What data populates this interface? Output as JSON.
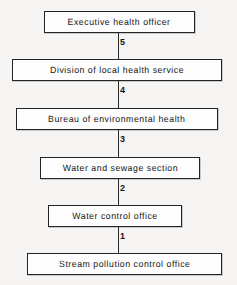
{
  "diagram": {
    "type": "flowchart",
    "orientation": "vertical-top-down",
    "background_color": "#f6f5f3",
    "box_fill_color": "#fefefe",
    "line_color": "#242424",
    "text_color": "#151515",
    "nodes": [
      {
        "id": "n5",
        "label": "Executive health officer",
        "level": 6,
        "left": 44,
        "top": 11,
        "width": 151
      },
      {
        "id": "n4",
        "label": "Division of local health service",
        "level": 5,
        "left": 12,
        "top": 59,
        "width": 210
      },
      {
        "id": "n3",
        "label": "Bureau of environmental health",
        "level": 4,
        "left": 16,
        "top": 108,
        "width": 202
      },
      {
        "id": "n2",
        "label": "Water and sewage section",
        "level": 3,
        "left": 40,
        "top": 157,
        "width": 160
      },
      {
        "id": "n1",
        "label": "Water control office",
        "level": 2,
        "left": 48,
        "top": 205,
        "width": 134
      },
      {
        "id": "n0",
        "label": "Stream pollution control office",
        "level": 1,
        "left": 27,
        "top": 253,
        "width": 195
      }
    ],
    "edges": [
      {
        "id": "e5",
        "label": "5",
        "from": "n5",
        "to": "n4",
        "top": 33,
        "height": 26,
        "label_x": 120,
        "label_y": 38
      },
      {
        "id": "e4",
        "label": "4",
        "from": "n4",
        "to": "n3",
        "top": 81,
        "height": 27,
        "label_x": 120,
        "label_y": 86
      },
      {
        "id": "e3",
        "label": "3",
        "from": "n3",
        "to": "n2",
        "top": 130,
        "height": 27,
        "label_x": 120,
        "label_y": 135
      },
      {
        "id": "e2",
        "label": "2",
        "from": "n2",
        "to": "n1",
        "top": 179,
        "height": 26,
        "label_x": 120,
        "label_y": 184
      },
      {
        "id": "e1",
        "label": "1",
        "from": "n1",
        "to": "n0",
        "top": 227,
        "height": 26,
        "label_x": 120,
        "label_y": 232
      }
    ]
  }
}
